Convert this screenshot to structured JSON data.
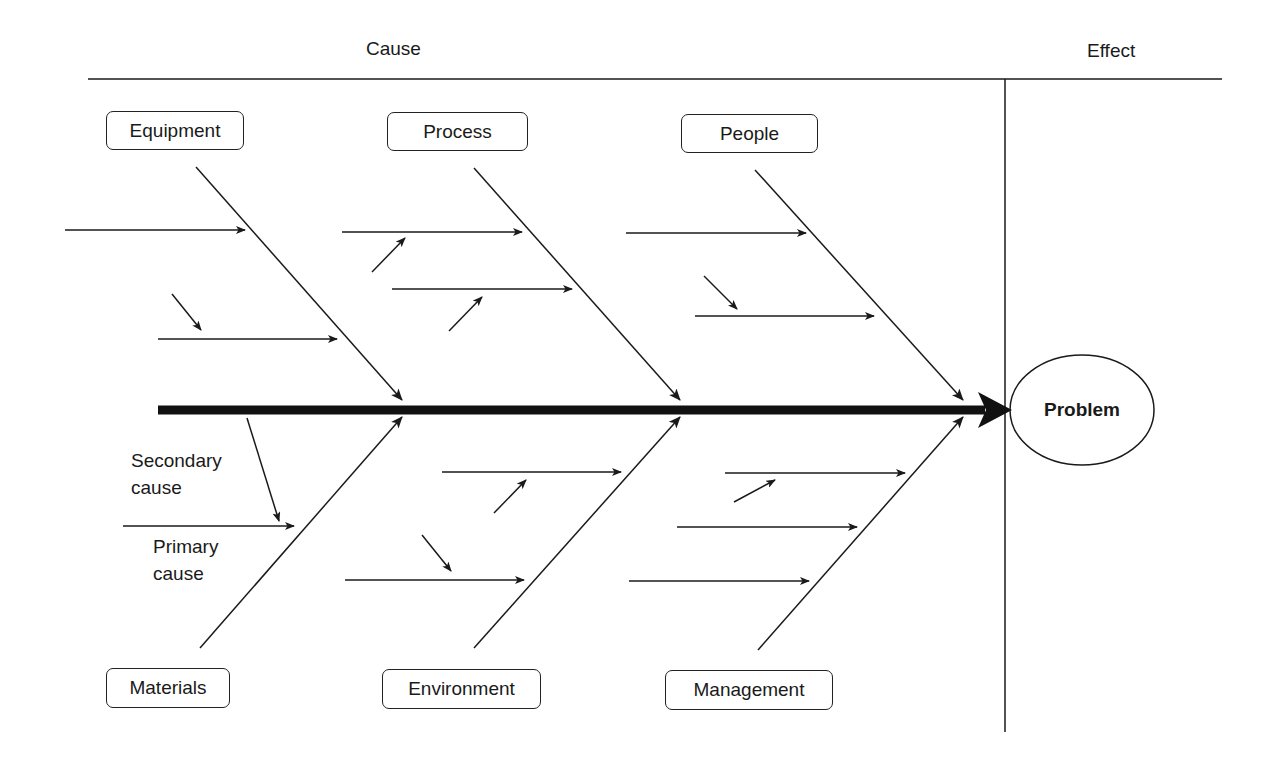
{
  "headers": {
    "cause": "Cause",
    "effect": "Effect"
  },
  "effect": {
    "label": "Problem"
  },
  "categories": {
    "top": [
      {
        "label": "Equipment"
      },
      {
        "label": "Process"
      },
      {
        "label": "People"
      }
    ],
    "bottom": [
      {
        "label": "Materials"
      },
      {
        "label": "Environment"
      },
      {
        "label": "Management"
      }
    ]
  },
  "annotations": {
    "secondary_line1": "Secondary",
    "secondary_line2": "cause",
    "primary_line1": "Primary",
    "primary_line2": "cause"
  },
  "colors": {
    "line": "#1a1a1a",
    "background": "#ffffff"
  }
}
